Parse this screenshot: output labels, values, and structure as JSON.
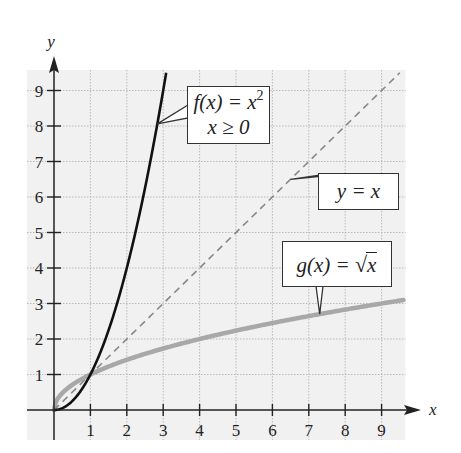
{
  "chart_data": {
    "type": "line",
    "title": "",
    "xlabel": "x",
    "ylabel": "y",
    "xlim": [
      0,
      9.6
    ],
    "ylim": [
      0,
      9.5
    ],
    "x_ticks": [
      "1",
      "2",
      "3",
      "4",
      "5",
      "6",
      "7",
      "8",
      "9"
    ],
    "y_ticks": [
      "1",
      "2",
      "3",
      "4",
      "5",
      "6",
      "7",
      "8",
      "9"
    ],
    "grid": true,
    "series": [
      {
        "name": "f(x) = x^2, x ≥ 0",
        "style": "solid black",
        "color": "#111111",
        "x": [
          0,
          0.5,
          1,
          1.5,
          2,
          2.5,
          3,
          3.08
        ],
        "y": [
          0,
          0.25,
          1,
          2.25,
          4,
          6.25,
          9,
          9.5
        ]
      },
      {
        "name": "y = x",
        "style": "dashed gray",
        "color": "#888888",
        "x": [
          0,
          9.5
        ],
        "y": [
          0,
          9.5
        ]
      },
      {
        "name": "g(x) = √x",
        "style": "thick light gray",
        "color": "#a8a8a8",
        "x": [
          0,
          0.25,
          1,
          2,
          3,
          4,
          5,
          6,
          7,
          8,
          9,
          9.6
        ],
        "y": [
          0,
          0.5,
          1,
          1.41,
          1.73,
          2,
          2.24,
          2.45,
          2.65,
          2.83,
          3,
          3.1
        ]
      }
    ],
    "annotations": [
      {
        "text_line1": "f(x) = x",
        "sup": "2",
        "text_line2": "x ≥ 0",
        "points_to": [
          2.84,
          8.06
        ]
      },
      {
        "text": "y = x",
        "points_to": [
          6.5,
          6.5
        ]
      },
      {
        "text": "g(x) = ",
        "radicand": "x",
        "points_to": [
          7.3,
          2.7
        ]
      }
    ],
    "legend": "none (callout labels)"
  },
  "labels": {
    "f_line1": "f(x) = x",
    "f_sup": "2",
    "f_line2": "x ≥ 0",
    "identity": "y = x",
    "g_prefix": "g(x) = ",
    "g_radical": "√",
    "g_radicand": "x"
  }
}
